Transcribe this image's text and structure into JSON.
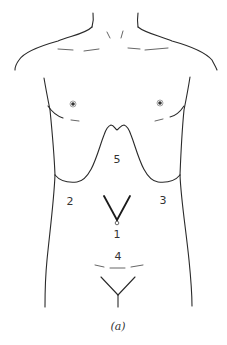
{
  "figure": {
    "caption": "(a)"
  },
  "regions": [
    {
      "id": "1",
      "label": "1",
      "x": 116,
      "y": 208
    },
    {
      "id": "2",
      "label": "2",
      "x": 70,
      "y": 201
    },
    {
      "id": "3",
      "label": "3",
      "x": 163,
      "y": 200
    },
    {
      "id": "4",
      "label": "4",
      "x": 118,
      "y": 255
    },
    {
      "id": "5",
      "label": "5",
      "x": 117,
      "y": 159
    }
  ],
  "colors": {
    "stroke": "#2a2a2a",
    "background": "#ffffff"
  }
}
